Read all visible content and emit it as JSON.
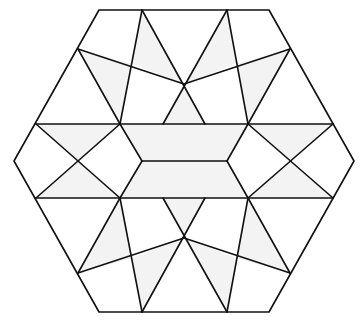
{
  "diagram": {
    "title": "",
    "colors": {
      "stroke": "#111111",
      "shade": "#f3f3f3",
      "background": "#ffffff"
    },
    "hexagon": [
      [
        99,
        10
      ],
      [
        269,
        10
      ],
      [
        354,
        161
      ],
      [
        269,
        312
      ],
      [
        99,
        312
      ],
      [
        14,
        161
      ]
    ],
    "shaded_regions": [
      [
        [
          120,
          124
        ],
        [
          248,
          124
        ],
        [
          227,
          161
        ],
        [
          142,
          161
        ]
      ],
      [
        [
          142,
          161
        ],
        [
          227,
          161
        ],
        [
          248,
          198
        ],
        [
          120,
          198
        ]
      ],
      [
        [
          163,
          124
        ],
        [
          184,
          84
        ],
        [
          205,
          124
        ]
      ],
      [
        [
          163,
          198
        ],
        [
          184,
          238
        ],
        [
          205,
          198
        ]
      ],
      [
        [
          36,
          124
        ],
        [
          120,
          124
        ],
        [
          78,
          161
        ]
      ],
      [
        [
          36,
          198
        ],
        [
          120,
          198
        ],
        [
          78,
          161
        ]
      ],
      [
        [
          248,
          124
        ],
        [
          333,
          124
        ],
        [
          290,
          161
        ]
      ],
      [
        [
          248,
          198
        ],
        [
          333,
          198
        ],
        [
          290,
          161
        ]
      ],
      [
        [
          142,
          10
        ],
        [
          184,
          84
        ],
        [
          132,
          64
        ]
      ],
      [
        [
          227,
          10
        ],
        [
          184,
          84
        ],
        [
          236,
          64
        ]
      ],
      [
        [
          142,
          312
        ],
        [
          184,
          238
        ],
        [
          132,
          258
        ]
      ],
      [
        [
          227,
          312
        ],
        [
          184,
          238
        ],
        [
          236,
          258
        ]
      ],
      [
        [
          78,
          49
        ],
        [
          132,
          64
        ],
        [
          120,
          124
        ]
      ],
      [
        [
          290,
          49
        ],
        [
          236,
          64
        ],
        [
          248,
          124
        ]
      ],
      [
        [
          78,
          273
        ],
        [
          132,
          258
        ],
        [
          120,
          198
        ]
      ],
      [
        [
          290,
          273
        ],
        [
          236,
          258
        ],
        [
          248,
          198
        ]
      ]
    ],
    "lines": [
      [
        [
          36,
          124
        ],
        [
          333,
          124
        ]
      ],
      [
        [
          36,
          198
        ],
        [
          333,
          198
        ]
      ],
      [
        [
          142,
          161
        ],
        [
          227,
          161
        ]
      ],
      [
        [
          120,
          124
        ],
        [
          142,
          161
        ]
      ],
      [
        [
          142,
          161
        ],
        [
          120,
          198
        ]
      ],
      [
        [
          248,
          124
        ],
        [
          227,
          161
        ]
      ],
      [
        [
          227,
          161
        ],
        [
          248,
          198
        ]
      ],
      [
        [
          36,
          124
        ],
        [
          120,
          198
        ]
      ],
      [
        [
          36,
          198
        ],
        [
          120,
          124
        ]
      ],
      [
        [
          333,
          124
        ],
        [
          248,
          198
        ]
      ],
      [
        [
          333,
          198
        ],
        [
          248,
          124
        ]
      ],
      [
        [
          142,
          10
        ],
        [
          120,
          124
        ]
      ],
      [
        [
          227,
          10
        ],
        [
          248,
          124
        ]
      ],
      [
        [
          142,
          10
        ],
        [
          205,
          124
        ]
      ],
      [
        [
          227,
          10
        ],
        [
          163,
          124
        ]
      ],
      [
        [
          78,
          49
        ],
        [
          184,
          84
        ]
      ],
      [
        [
          290,
          49
        ],
        [
          184,
          84
        ]
      ],
      [
        [
          78,
          49
        ],
        [
          120,
          124
        ]
      ],
      [
        [
          290,
          49
        ],
        [
          248,
          124
        ]
      ],
      [
        [
          142,
          312
        ],
        [
          120,
          198
        ]
      ],
      [
        [
          227,
          312
        ],
        [
          248,
          198
        ]
      ],
      [
        [
          142,
          312
        ],
        [
          205,
          198
        ]
      ],
      [
        [
          227,
          312
        ],
        [
          163,
          198
        ]
      ],
      [
        [
          78,
          273
        ],
        [
          184,
          238
        ]
      ],
      [
        [
          290,
          273
        ],
        [
          184,
          238
        ]
      ],
      [
        [
          78,
          273
        ],
        [
          120,
          198
        ]
      ],
      [
        [
          290,
          273
        ],
        [
          248,
          198
        ]
      ]
    ]
  }
}
